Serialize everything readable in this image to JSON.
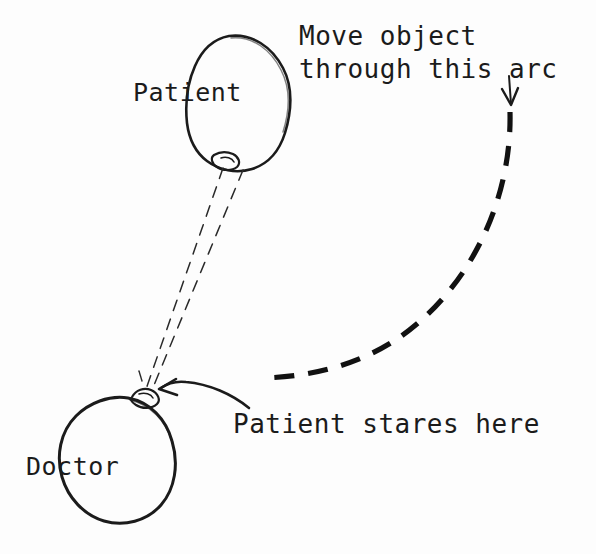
{
  "diagram": {
    "style": "hand-drawn pen sketch",
    "background_color": "#fdfdfd",
    "ink_color": "#1b1b1b",
    "labels": {
      "patient": "Patient",
      "doctor": "Doctor",
      "stares_here": "Patient stares here",
      "move_object_line1": "Move object",
      "move_object_line2": "through this arc"
    },
    "figures": [
      {
        "name": "patient-head",
        "label": "Patient",
        "shape": "egg-outline",
        "center": [
          238,
          100
        ],
        "feature": "nose at lower-left"
      },
      {
        "name": "doctor-head",
        "label": "Doctor",
        "shape": "oval-outline",
        "center": [
          116,
          455
        ],
        "feature": "nose at upper-right"
      }
    ],
    "annotations": [
      {
        "name": "sight-lines",
        "style": "thin dashed",
        "from": "patient-eyes",
        "to": "doctor-head-top",
        "count": 2
      },
      {
        "name": "motion-arc",
        "style": "thick dashed",
        "direction": "downward-left",
        "from": [
          510,
          112
        ],
        "to": [
          262,
          377
        ]
      },
      {
        "name": "arc-direction-arrow",
        "style": "thin arrow",
        "points": "down",
        "at": [
          510,
          95
        ]
      },
      {
        "name": "stare-pointer-arrow",
        "style": "curved arrow",
        "points": "left",
        "to": [
          160,
          389
        ]
      }
    ]
  }
}
